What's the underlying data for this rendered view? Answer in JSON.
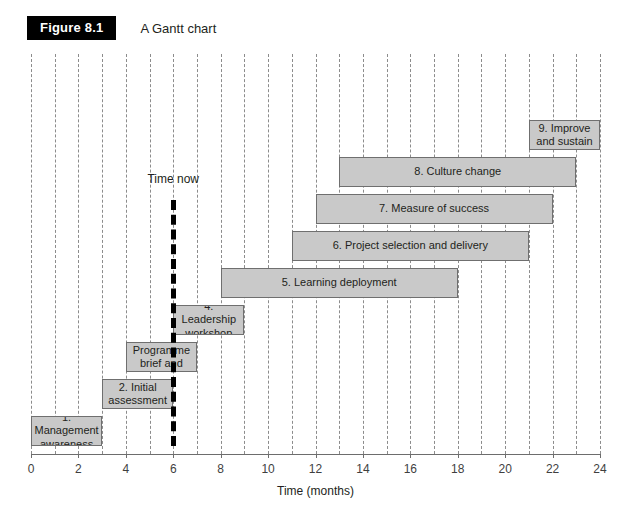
{
  "figure": {
    "badge": "Figure 8.1",
    "caption": "A Gantt chart"
  },
  "chart_data": {
    "type": "bar",
    "chart_subtype": "gantt",
    "title": "A Gantt chart",
    "xlabel": "Time (months)",
    "ylabel": "",
    "xlim": [
      0,
      24
    ],
    "xtick_step": 2,
    "gridline_step": 1,
    "grid": true,
    "legend": "none",
    "xticks": [
      0,
      2,
      4,
      6,
      8,
      10,
      12,
      14,
      16,
      18,
      20,
      22,
      24
    ],
    "xticklabels": [
      "0",
      "2",
      "4",
      "6",
      "8",
      "10",
      "12",
      "14",
      "16",
      "18",
      "20",
      "22",
      "24"
    ],
    "bar_fill_color": "#c9c9c9",
    "bar_border_color": "#6f6f6f",
    "gridline_color": "#8c8c8c",
    "marker_color": "#000000",
    "tasks": [
      {
        "id": 1,
        "label": "1. Management awareness",
        "start": 0,
        "end": 3,
        "row": 0
      },
      {
        "id": 2,
        "label": "2. Initial assessment",
        "start": 3,
        "end": 6,
        "row": 1
      },
      {
        "id": 3,
        "label": "3. Programme brief and org.",
        "start": 4,
        "end": 7,
        "row": 2
      },
      {
        "id": 4,
        "label": "4. Leadership workshop",
        "start": 6,
        "end": 9,
        "row": 3
      },
      {
        "id": 5,
        "label": "5. Learning deployment",
        "start": 8,
        "end": 18,
        "row": 4
      },
      {
        "id": 6,
        "label": "6. Project selection and delivery",
        "start": 11,
        "end": 21,
        "row": 5
      },
      {
        "id": 7,
        "label": "7. Measure of success",
        "start": 12,
        "end": 22,
        "row": 6
      },
      {
        "id": 8,
        "label": "8. Culture change",
        "start": 13,
        "end": 23,
        "row": 7
      },
      {
        "id": 9,
        "label": "9. Improve and sustain",
        "start": 21,
        "end": 24,
        "row": 8
      }
    ],
    "annotations": [
      {
        "name": "time-now",
        "label": "Time now",
        "x": 6,
        "type": "vertical-marker"
      }
    ]
  }
}
